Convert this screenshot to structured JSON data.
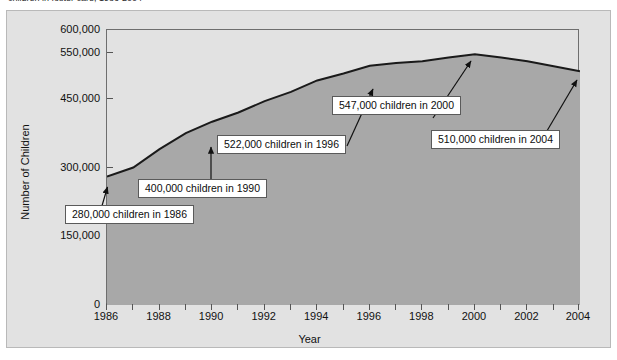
{
  "caption": {
    "text": "children in foster care, 1986-2004"
  },
  "chart_data": {
    "type": "area",
    "title": "",
    "xlabel": "Year",
    "ylabel": "Number of Children",
    "xlim": [
      1986,
      2004
    ],
    "ylim": [
      0,
      600000
    ],
    "grid": false,
    "legend": "none",
    "y_ticks": [
      {
        "value": 600000,
        "label": "600,000"
      },
      {
        "value": 550000,
        "label": "550,000"
      },
      {
        "value": 450000,
        "label": "450,000"
      },
      {
        "value": 300000,
        "label": "300,000"
      },
      {
        "value": 150000,
        "label": "150,000"
      },
      {
        "value": 0,
        "label": "0"
      }
    ],
    "x_ticks": [
      {
        "value": 1986,
        "label": "1986"
      },
      {
        "value": 1988,
        "label": "1988"
      },
      {
        "value": 1990,
        "label": "1990"
      },
      {
        "value": 1992,
        "label": "1992"
      },
      {
        "value": 1994,
        "label": "1994"
      },
      {
        "value": 1996,
        "label": "1996"
      },
      {
        "value": 1998,
        "label": "1998"
      },
      {
        "value": 2000,
        "label": "2000"
      },
      {
        "value": 2002,
        "label": "2002"
      },
      {
        "value": 2004,
        "label": "2004"
      }
    ],
    "x_minor_ticks": [
      1987,
      1989,
      1991,
      1993,
      1995,
      1997,
      1999,
      2001,
      2003
    ],
    "x": [
      1986,
      1987,
      1988,
      1989,
      1990,
      1991,
      1992,
      1993,
      1994,
      1995,
      1996,
      1997,
      1998,
      1999,
      2000,
      2001,
      2002,
      2003,
      2004
    ],
    "values": [
      280000,
      300000,
      340000,
      375000,
      400000,
      420000,
      445000,
      465000,
      490000,
      505000,
      522000,
      528000,
      532000,
      540000,
      547000,
      540000,
      532000,
      521000,
      510000
    ],
    "series_name": "Number of Children",
    "area_fill_color": "#a8a8a8",
    "line_color": "#1a1a1a",
    "plot_background_color": "#e2e2e2",
    "panel_background_color": "#e2e2e2",
    "annotations": [
      {
        "id": "ann-1986",
        "text": "280,000 children in 1986",
        "year": 1986,
        "value": 280000
      },
      {
        "id": "ann-1990",
        "text": "400,000 children in 1990",
        "year": 1990,
        "value": 400000
      },
      {
        "id": "ann-1996",
        "text": "522,000 children in 1996",
        "year": 1996,
        "value": 522000
      },
      {
        "id": "ann-2000",
        "text": "547,000 children in 2000",
        "year": 2000,
        "value": 547000
      },
      {
        "id": "ann-2004",
        "text": "510,000 children in 2004",
        "year": 2004,
        "value": 510000
      }
    ]
  }
}
